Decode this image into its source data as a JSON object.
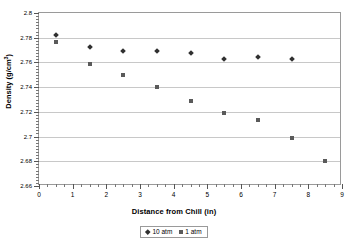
{
  "chart_data": {
    "type": "scatter",
    "title": "",
    "xlabel": "Distance from Chill (in)",
    "ylabel": "Density (g/cm³)",
    "ylabel_main": "Density (g/cm",
    "ylabel_sup": "3",
    "ylabel_tail": ")",
    "xlim": [
      0,
      9
    ],
    "ylim": [
      2.66,
      2.8
    ],
    "x": [
      0.5,
      1.5,
      2.5,
      3.5,
      4.5,
      5.5,
      6.5,
      7.5,
      8.5
    ],
    "xticks": [
      0,
      1,
      2,
      3,
      4,
      5,
      6,
      7,
      8,
      9
    ],
    "xtick_labels": [
      "0",
      "1",
      "2",
      "3",
      "4",
      "5",
      "6",
      "7",
      "8",
      "9"
    ],
    "yticks": [
      2.66,
      2.68,
      2.7,
      2.72,
      2.74,
      2.76,
      2.78,
      2.8
    ],
    "ytick_labels": [
      "2.66",
      "2.68",
      "2.7",
      "2.72",
      "2.74",
      "2.76",
      "2.78",
      "2.8"
    ],
    "xminor_step": 0.25,
    "yminor_step": 0.0025,
    "grid": "horizontal",
    "legend_position": "bottom-center",
    "series": [
      {
        "name": "10 atm",
        "marker": "diamond",
        "color": "#303030",
        "x": [
          0.5,
          1.5,
          2.5,
          3.5,
          4.5,
          5.5,
          6.5,
          7.5
        ],
        "values": [
          2.7825,
          2.7725,
          2.769,
          2.769,
          2.7675,
          2.763,
          2.764,
          2.763
        ]
      },
      {
        "name": "1 atm",
        "marker": "square",
        "color": "#5a5a5a",
        "x": [
          0.5,
          1.5,
          2.5,
          3.5,
          4.5,
          5.5,
          6.5,
          7.5,
          8.5
        ],
        "values": [
          2.7765,
          2.759,
          2.75,
          2.74,
          2.729,
          2.719,
          2.7135,
          2.699,
          2.68
        ]
      }
    ]
  },
  "legend": {
    "items": [
      {
        "label": "10 atm"
      },
      {
        "label": "1 atm"
      }
    ]
  }
}
